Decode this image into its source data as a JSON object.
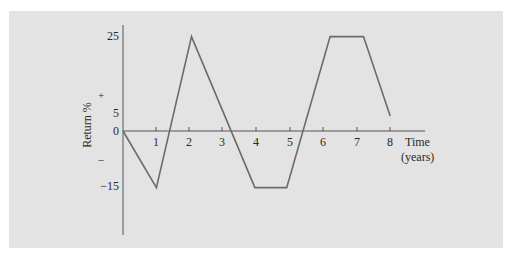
{
  "chart_data": {
    "type": "line",
    "title": "",
    "xlabel": "Time (years)",
    "xlabel_lines": [
      "Time",
      "(years)"
    ],
    "ylabel": "Return %",
    "x_ticks": [
      "1",
      "2",
      "3",
      "4",
      "5",
      "6",
      "7",
      "8"
    ],
    "y_ticks": [
      "25",
      "5",
      "0",
      "−15"
    ],
    "y_sign_markers": {
      "positive": "+",
      "negative": "–"
    },
    "xlim": [
      0,
      8.5
    ],
    "ylim": [
      -25,
      28
    ],
    "grid": false,
    "legend": null,
    "series": [
      {
        "name": "Return",
        "x": [
          0,
          1,
          2.05,
          3.95,
          4.9,
          6.2,
          7.2,
          8
        ],
        "y": [
          0,
          -15,
          25,
          -15,
          -15,
          25,
          25,
          4
        ]
      }
    ],
    "line_color": "#6b6b6b",
    "background_color": "#e3e3e3",
    "axis_color": "#555555"
  }
}
